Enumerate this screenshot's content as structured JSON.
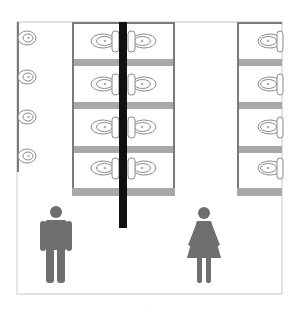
{
  "diagram": {
    "type": "restroom floor plan",
    "colors": {
      "wall": "#7a7a7a",
      "partition_bar": "#a9a9a9",
      "divider": "#111111",
      "fixture_stroke": "#8a8a8a",
      "figure": "#6f6f6f",
      "frame": "#c8c8c8"
    },
    "left_wall_urinals": 4,
    "center_stall_rows": 4,
    "right_stall_rows": 4,
    "icons": {
      "men": "man-icon",
      "women": "woman-icon"
    },
    "caption": "-"
  }
}
